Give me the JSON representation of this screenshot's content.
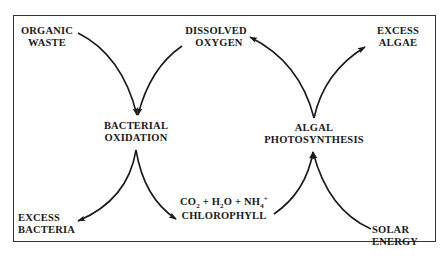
{
  "diagram": {
    "title": "",
    "nodes": {
      "organic_waste": [
        "ORGANIC",
        "WASTE"
      ],
      "dissolved_oxygen": [
        "DISSOLVED",
        "OXYGEN"
      ],
      "excess_algae": [
        "EXCESS",
        "ALGAE"
      ],
      "bacterial_oxidation": [
        "BACTERIAL",
        "OXIDATION"
      ],
      "algal_photosynthesis": [
        "ALGAL",
        "PHOTOSYNTHESIS"
      ],
      "excess_bacteria": [
        "EXCESS",
        "BACTERIA"
      ],
      "products": {
        "co2": "CO",
        "co2_sub": "2",
        "plus1": " + ",
        "h2o_h": "H",
        "h2o_sub": "2",
        "h2o_o": "O",
        "plus2": " + ",
        "nh4": "NH",
        "nh4_sub": "4",
        "nh4_sup": "+",
        "chlorophyll": "CHLOROPHYLL"
      },
      "solar_energy": [
        "SOLAR",
        "ENERGY"
      ]
    },
    "edges": [
      {
        "from": "ORGANIC WASTE",
        "to": "BACTERIAL OXIDATION"
      },
      {
        "from": "DISSOLVED OXYGEN",
        "to": "BACTERIAL OXIDATION"
      },
      {
        "from": "BACTERIAL OXIDATION",
        "to": "EXCESS BACTERIA"
      },
      {
        "from": "BACTERIAL OXIDATION",
        "to": "CO2 + H2O + NH4+ CHLOROPHYLL"
      },
      {
        "from": "CO2 + H2O + NH4+ CHLOROPHYLL",
        "to": "ALGAL PHOTOSYNTHESIS"
      },
      {
        "from": "SOLAR ENERGY",
        "to": "ALGAL PHOTOSYNTHESIS"
      },
      {
        "from": "ALGAL PHOTOSYNTHESIS",
        "to": "DISSOLVED OXYGEN"
      },
      {
        "from": "ALGAL PHOTOSYNTHESIS",
        "to": "EXCESS ALGAE"
      }
    ],
    "colors": {
      "ink": "#1a1a1a",
      "background": "#ffffff"
    }
  }
}
